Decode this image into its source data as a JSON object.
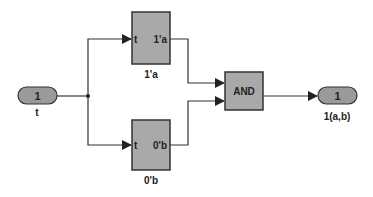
{
  "diagram": {
    "type": "simulink-block-diagram",
    "inport": {
      "number": "1",
      "label": "t"
    },
    "blocks": [
      {
        "id": "block_a",
        "input_port": "t",
        "output_port": "1'a",
        "caption": "1'a"
      },
      {
        "id": "block_b",
        "input_port": "t",
        "output_port": "0'b",
        "caption": "0'b"
      }
    ],
    "logic_block": {
      "label": "AND"
    },
    "outport": {
      "number": "1",
      "label": "1(a,b)"
    },
    "colors": {
      "block_fill": "#a9a9a9",
      "port_fill": "#9a9a9a",
      "line": "#333333"
    }
  }
}
